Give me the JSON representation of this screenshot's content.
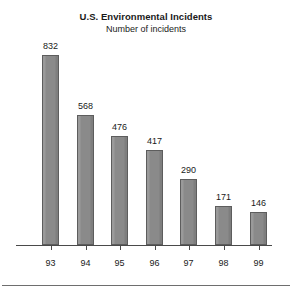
{
  "chart_data": {
    "type": "bar",
    "title": "U.S. Environmental Incidents",
    "subtitle": "Number of incidents",
    "xlabel": "",
    "ylabel": "",
    "categories": [
      "93",
      "94",
      "95",
      "96",
      "97",
      "98",
      "99"
    ],
    "values": [
      832,
      568,
      476,
      417,
      290,
      171,
      146
    ],
    "value_labels": [
      "832",
      "568",
      "476",
      "417",
      "290",
      "171",
      "146"
    ],
    "ylim": [
      0,
      832
    ],
    "grid": false,
    "legend": null,
    "legend_position": "none",
    "bar_color": "#8a8a8a",
    "bar_border_color": "#5d5d5d",
    "axis_color": "#4a4a4a",
    "text_color": "#1a1a1a",
    "background": "#ffffff",
    "annotations": [
      "Value labels printed above each bar",
      "Single horizontal baseline axis with tick marks under each bar",
      "Horizontal rule across the bottom of the figure"
    ]
  }
}
